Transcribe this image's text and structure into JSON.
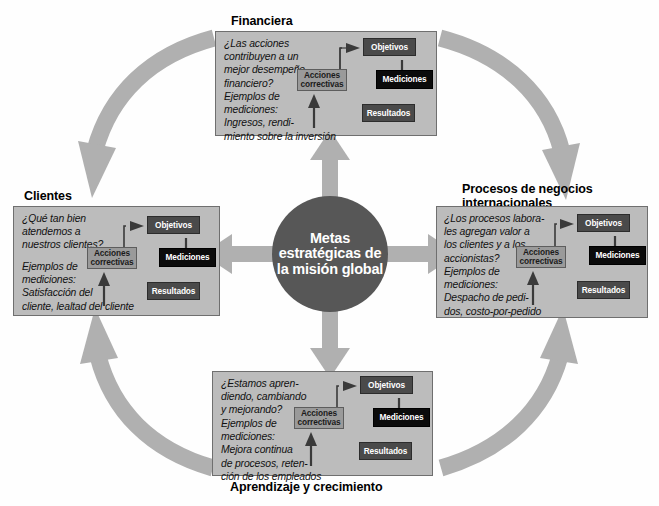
{
  "center": {
    "text": "Metas\nestratégicas\nde la misión\nglobal",
    "color": "#575757"
  },
  "node_labels": {
    "objetivos": "Objetivos",
    "mediciones": "Mediciones",
    "resultados": "Resultados",
    "acciones": "Acciones\ncorrectivas"
  },
  "colors": {
    "panel_fill": "#bcbcbc",
    "panel_border": "#6f6f6f",
    "arrow_gray": "#b0b0b0",
    "node_dark": "#4a4a4a",
    "node_black": "#0b0b0b",
    "node_light": "#9a9a9a",
    "background": "#ffffff"
  },
  "panels": [
    {
      "id": "financiera",
      "title": "Financiera",
      "question": "¿Las acciones\ncontribuyen a un\nmejor desempeño\nfinanciero?",
      "examples": "Ejemplos de\nmediciones:\nIngresos, rendi-\nmiento sobre la inversión"
    },
    {
      "id": "clientes",
      "title": "Clientes",
      "question": "¿Qué tan bien\natendemos a\nnuestros clientes?",
      "examples": "Ejemplos de\nmediciones:\nSatisfacción del\ncliente, lealtad del cliente"
    },
    {
      "id": "procesos",
      "title": "Procesos de negocios\ninternacionales",
      "question": "¿Los procesos labora-\nles agregan valor a\nlos clientes y a los\naccionistas?",
      "examples": "Ejemplos de\nmediciones:\nDespacho de pedi-\ndos, costo-por-pedido"
    },
    {
      "id": "aprendizaje",
      "title": "Aprendizaje y crecimiento",
      "question": "¿Estamos apren-\ndiendo, cambiando\ny mejorando?",
      "examples": "Ejemplos de\nmediciones:\nMejora continua\nde procesos, reten-\nción de los empleados"
    }
  ]
}
